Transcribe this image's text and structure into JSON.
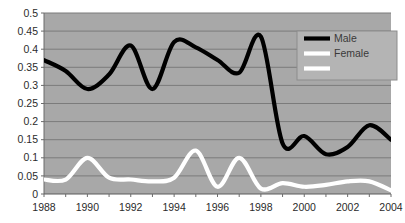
{
  "chart_data": {
    "type": "line",
    "title": "",
    "xlabel": "",
    "ylabel": "",
    "xlim": [
      1988,
      2004
    ],
    "ylim": [
      0,
      0.5
    ],
    "grid": true,
    "legend_position": "top-right",
    "plot_background": "#a8a8a8",
    "gridline_color": "#7b7b7b",
    "x": [
      1988,
      1989,
      1990,
      1991,
      1992,
      1993,
      1994,
      1995,
      1996,
      1997,
      1998,
      1999,
      2000,
      2001,
      2002,
      2003,
      2004
    ],
    "xticks": [
      1988,
      1989,
      1990,
      1991,
      1992,
      1993,
      1994,
      1995,
      1996,
      1997,
      1998,
      1999,
      2000,
      2001,
      2002,
      2003,
      2004
    ],
    "xtick_labels": [
      "1988",
      "",
      "1990",
      "",
      "1992",
      "",
      "1994",
      "",
      "1996",
      "",
      "1998",
      "",
      "2000",
      "",
      "2002",
      "",
      "2004"
    ],
    "yticks": [
      0,
      0.05,
      0.1,
      0.15,
      0.2,
      0.25,
      0.3,
      0.35,
      0.4,
      0.45,
      0.5
    ],
    "ytick_labels": [
      "0",
      "0.05",
      "0.1",
      "0.15",
      "0.2",
      "0.25",
      "0.3",
      "0.35",
      "0.4",
      "0.45",
      "0.5"
    ],
    "series": [
      {
        "name": "Male",
        "color": "#000000",
        "values": [
          0.37,
          0.34,
          0.29,
          0.33,
          0.41,
          0.29,
          0.42,
          0.405,
          0.37,
          0.335,
          0.435,
          0.14,
          0.16,
          0.11,
          0.13,
          0.19,
          0.15
        ]
      },
      {
        "name": "Female",
        "color": "#ffffff",
        "values": [
          0.04,
          0.04,
          0.1,
          0.045,
          0.04,
          0.035,
          0.045,
          0.12,
          0.02,
          0.1,
          0.015,
          0.03,
          0.02,
          0.025,
          0.035,
          0.035,
          0.01
        ]
      }
    ],
    "legend_entries": [
      {
        "label": "Male",
        "color": "#000000"
      },
      {
        "label": "Female",
        "color": "#ffffff"
      },
      {
        "label": "",
        "color": "#ffffff"
      }
    ]
  }
}
